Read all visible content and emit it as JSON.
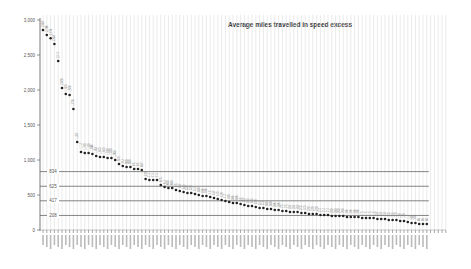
{
  "chart_data": {
    "type": "scatter",
    "title": "Average miles travelled in speed excess",
    "xlabel": "",
    "ylabel": "",
    "ylim": [
      0,
      3000
    ],
    "yticks": [
      0,
      500,
      1000,
      1500,
      2000,
      2500,
      3000
    ],
    "ytick_labels": [
      "0",
      "500",
      "1,000",
      "1,500",
      "2,000",
      "2,500",
      "3,000"
    ],
    "grid": {
      "vertical": true,
      "horizontal": false
    },
    "legend": null,
    "reference_lines": [
      {
        "value": 834,
        "label": "834"
      },
      {
        "value": 625,
        "label": "625"
      },
      {
        "value": 417,
        "label": "417"
      },
      {
        "value": 208,
        "label": "208"
      }
    ],
    "point_count": 102,
    "values": [
      2857,
      2786,
      2740,
      2657,
      2414,
      2028,
      1943,
      1928,
      1728,
      1257,
      1114,
      1100,
      1100,
      1086,
      1057,
      1043,
      1043,
      1029,
      1029,
      1000,
      943,
      914,
      900,
      900,
      871,
      871,
      857,
      729,
      714,
      714,
      714,
      643,
      614,
      600,
      600,
      571,
      557,
      543,
      529,
      529,
      514,
      500,
      486,
      486,
      471,
      457,
      443,
      429,
      414,
      400,
      386,
      386,
      371,
      357,
      343,
      343,
      329,
      314,
      314,
      300,
      300,
      286,
      286,
      271,
      271,
      257,
      257,
      257,
      243,
      243,
      229,
      229,
      229,
      214,
      214,
      214,
      200,
      200,
      200,
      200,
      186,
      186,
      186,
      186,
      171,
      171,
      171,
      171,
      157,
      157,
      157,
      143,
      143,
      143,
      129,
      129,
      114,
      100,
      100,
      86,
      86,
      86
    ],
    "categories_note": "x-axis category labels are rotated and illegible at this resolution"
  }
}
